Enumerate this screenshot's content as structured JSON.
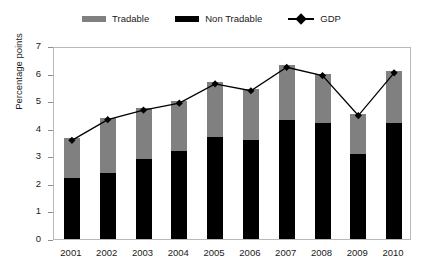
{
  "legend": {
    "items": [
      {
        "label": "Tradable",
        "swatch": "gray-bar-swatch",
        "color": "#808080",
        "type": "bar"
      },
      {
        "label": "Non Tradable",
        "swatch": "black-bar-swatch",
        "color": "#000000",
        "type": "bar"
      },
      {
        "label": "GDP",
        "swatch": "diamond-line-marker",
        "color": "#000000",
        "type": "line"
      }
    ]
  },
  "axes": {
    "y_title": "Percentage points",
    "y_ticks": [
      "0",
      "1",
      "2",
      "3",
      "4",
      "5",
      "6",
      "7"
    ],
    "x_title": ""
  },
  "chart_data": {
    "type": "bar",
    "title": "",
    "subtitle": "",
    "xlabel": "",
    "ylabel": "Percentage points",
    "ylim": [
      0,
      7
    ],
    "ytick_interval": 1,
    "grid": false,
    "stacked": true,
    "legend_position": "top-center",
    "categories": [
      "2001",
      "2002",
      "2003",
      "2004",
      "2005",
      "2006",
      "2007",
      "2008",
      "2009",
      "2010"
    ],
    "series": [
      {
        "name": "Non Tradable",
        "type": "bar",
        "color": "#000000",
        "values": [
          2.2,
          2.4,
          2.9,
          3.2,
          3.7,
          3.6,
          4.3,
          4.2,
          3.1,
          4.2
        ]
      },
      {
        "name": "Tradable",
        "type": "bar",
        "color": "#808080",
        "values": [
          1.45,
          2.0,
          1.85,
          1.8,
          2.0,
          1.85,
          2.0,
          1.8,
          1.45,
          1.9
        ]
      },
      {
        "name": "GDP",
        "type": "line",
        "color": "#000000",
        "marker": "diamond",
        "values": [
          3.65,
          4.4,
          4.75,
          5.0,
          5.7,
          5.45,
          6.3,
          6.0,
          4.55,
          6.1
        ]
      }
    ],
    "stack_totals": [
      3.65,
      4.4,
      4.75,
      5.0,
      5.7,
      5.45,
      6.3,
      6.0,
      4.55,
      6.1
    ]
  }
}
